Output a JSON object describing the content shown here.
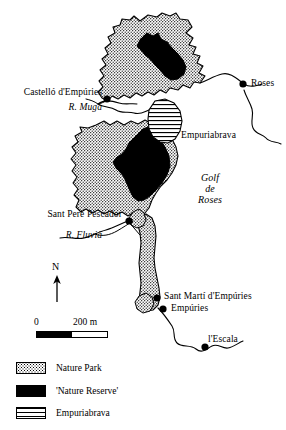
{
  "map": {
    "title": "Gulf of Roses coastal map with Nature Park and Nature Reserve zones",
    "places": [
      {
        "name": "Castelló d'Empúries",
        "label": "Castelló d'Empúries",
        "kind": "town",
        "has_marker": true
      },
      {
        "name": "Roses",
        "label": "Roses",
        "kind": "town",
        "has_marker": true
      },
      {
        "name": "Empuriabrava",
        "label": "Empuriabrava",
        "kind": "resort",
        "has_marker": false
      },
      {
        "name": "Sant Pere Pescador",
        "label": "Sant Pere Pescador",
        "kind": "town",
        "has_marker": true
      },
      {
        "name": "Sant Martí d'Empúries",
        "label": "Sant Martí d'Empúries",
        "kind": "town",
        "has_marker": true
      },
      {
        "name": "Empúries",
        "label": "Empúries",
        "kind": "town",
        "has_marker": true
      },
      {
        "name": "l'Escala",
        "label": "l'Escala",
        "kind": "town",
        "has_marker": true
      }
    ],
    "rivers": [
      {
        "name": "R. Muga",
        "label": "R. Muga"
      },
      {
        "name": "R. Fluvià",
        "label": "R. Fluvià"
      }
    ],
    "water_bodies": [
      {
        "name": "Golf de Roses",
        "line1": "Golf",
        "line2": "de",
        "line3": "Roses"
      }
    ],
    "north_arrow": {
      "label": "N"
    },
    "scale_bar": {
      "start_label": "0",
      "end_label": "200 m",
      "length_value": 200,
      "units": "m"
    }
  },
  "legend": {
    "items": [
      {
        "label": "Nature Park",
        "pattern": "dotted-stipple",
        "color": "#000000"
      },
      {
        "label": "'Nature Reserve'",
        "pattern": "solid-black",
        "color": "#000000"
      },
      {
        "label": "Empuriabrava",
        "pattern": "horizontal-lines",
        "color": "#000000"
      }
    ]
  },
  "colors": {
    "ink": "#000000",
    "background": "#ffffff"
  }
}
